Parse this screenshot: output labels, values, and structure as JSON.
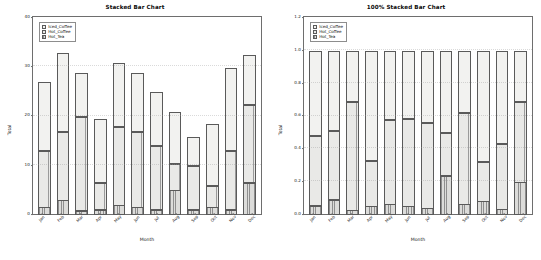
{
  "chart_data": [
    {
      "type": "bar",
      "stacked": "absolute",
      "title": "Stacked Bar Chart",
      "xlabel": "Month",
      "ylabel": "Total",
      "categories": [
        "Jan",
        "Feb",
        "Mar",
        "Apr",
        "May",
        "Jun",
        "Jul",
        "Aug",
        "Sep",
        "Oct",
        "Nov",
        "Dec"
      ],
      "ylim": [
        0,
        40
      ],
      "yticks": [
        0,
        10,
        20,
        30,
        40
      ],
      "ytick_labels": [
        "0",
        "10",
        "20",
        "30",
        "40"
      ],
      "grid": false,
      "legend_position": "upper left",
      "series": [
        {
          "name": "Hot_Tea",
          "values": [
            1.5,
            3.0,
            0.8,
            1.0,
            2.0,
            1.5,
            1.0,
            5.0,
            1.0,
            1.5,
            1.0,
            6.5
          ]
        },
        {
          "name": "Hot_Coffee",
          "values": [
            11.5,
            14.0,
            19.2,
            5.5,
            16.0,
            15.5,
            13.0,
            5.5,
            9.0,
            4.5,
            12.0,
            16.0
          ]
        },
        {
          "name": "Iced_Coffee",
          "values": [
            14.0,
            16.0,
            9.0,
            13.0,
            13.0,
            12.0,
            11.0,
            10.5,
            6.0,
            12.5,
            17.0,
            10.0
          ]
        }
      ],
      "totals": [
        27.0,
        33.0,
        29.0,
        19.5,
        31.0,
        29.0,
        25.0,
        21.0,
        16.0,
        18.5,
        30.0,
        32.5
      ]
    },
    {
      "type": "bar",
      "stacked": "percent",
      "title": "100% Stacked Bar Chart",
      "xlabel": "Month",
      "ylabel": "Total",
      "categories": [
        "Jan",
        "Feb",
        "Mar",
        "Apr",
        "May",
        "Jun",
        "Jul",
        "Aug",
        "Sep",
        "Oct",
        "Nov",
        "Dec"
      ],
      "ylim": [
        0,
        1.2
      ],
      "yticks": [
        0.0,
        0.2,
        0.4,
        0.6,
        0.8,
        1.0,
        1.2
      ],
      "ytick_labels": [
        "0.0",
        "0.2",
        "0.4",
        "0.6",
        "0.8",
        "1.0",
        "1.2"
      ],
      "grid": false,
      "legend_position": "upper left",
      "series": [
        {
          "name": "Hot_Tea",
          "values": [
            0.056,
            0.091,
            0.028,
            0.051,
            0.065,
            0.052,
            0.04,
            0.238,
            0.063,
            0.081,
            0.033,
            0.2
          ]
        },
        {
          "name": "Hot_Coffee",
          "values": [
            0.426,
            0.424,
            0.662,
            0.282,
            0.516,
            0.534,
            0.52,
            0.262,
            0.563,
            0.243,
            0.4,
            0.492
          ]
        },
        {
          "name": "Iced_Coffee",
          "values": [
            0.518,
            0.485,
            0.31,
            0.667,
            0.419,
            0.414,
            0.44,
            0.5,
            0.374,
            0.676,
            0.567,
            0.308
          ]
        }
      ]
    }
  ],
  "legend": {
    "items": [
      {
        "label": "Iced_Coffee",
        "key": "iced"
      },
      {
        "label": "Hot_Coffee",
        "key": "hot-coffee"
      },
      {
        "label": "Hot_Tea",
        "key": "hot-tea"
      }
    ]
  },
  "colors": {
    "iced_coffee": "#f2f2f0",
    "hot_coffee": "#c9c9c7",
    "hot_tea": "#b8b8b6",
    "axis": "#6e6e6e",
    "text": "#101010"
  }
}
